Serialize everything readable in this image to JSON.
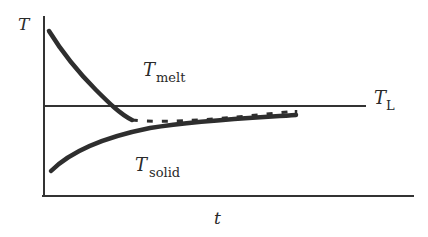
{
  "diagram": {
    "type": "temperature-vs-time schematic",
    "axes": {
      "y_label": "T",
      "x_label": "t"
    },
    "reference_line": {
      "label_main": "T",
      "label_sub": "L",
      "style": "solid"
    },
    "curves": [
      {
        "name": "melt",
        "label_main": "T",
        "label_sub": "melt",
        "style": "solid thick",
        "trend": "decreasing, approaches T_L from above then continues below as dashed"
      },
      {
        "name": "transition",
        "style": "dashed",
        "trend": "slightly below T_L, converging toward T_L"
      },
      {
        "name": "solid",
        "label_main": "T",
        "label_sub": "solid",
        "style": "solid thick",
        "trend": "increasing, approaches T_L from below"
      }
    ],
    "colors": {
      "ink": "#2a2a2a",
      "background": "#ffffff"
    }
  }
}
